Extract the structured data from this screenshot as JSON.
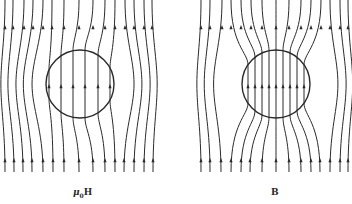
{
  "colors": {
    "line": "#2a2a2a",
    "background": "#ffffff"
  },
  "panels": [
    {
      "id": "muH",
      "label_main": "μ",
      "label_sub": "0",
      "label_tail": "H",
      "label_pos": {
        "x": 73,
        "y": 187
      },
      "circle": {
        "cx": 80,
        "cy": 84,
        "r": 34
      },
      "mode": "diverge",
      "top_xs": [
        5,
        13,
        24,
        33,
        43,
        52,
        64,
        79,
        93,
        105,
        115,
        125,
        134,
        144,
        152
      ],
      "bottom_xs": [
        5,
        14,
        23,
        32,
        43,
        53,
        64,
        79,
        93,
        105,
        115,
        124,
        134,
        144,
        153
      ],
      "inner_xs": [
        49,
        61,
        73,
        85,
        98,
        110
      ],
      "y_top": 0,
      "y_bottom": 172,
      "arrow_top_y": 27,
      "arrow_bottom_y": 160,
      "arrow_mid_y": 86
    },
    {
      "id": "B",
      "label_main": "B",
      "label_sub": "",
      "label_tail": "",
      "label_pos": {
        "x": 271,
        "y": 187
      },
      "circle": {
        "cx": 276,
        "cy": 84,
        "r": 34
      },
      "mode": "converge",
      "top_xs": [
        201,
        210,
        222,
        231,
        241,
        251,
        262,
        276,
        289,
        301,
        311,
        321,
        330,
        340,
        348
      ],
      "bottom_xs": [
        201,
        210,
        221,
        231,
        241,
        250,
        262,
        276,
        289,
        301,
        311,
        320,
        330,
        340,
        348
      ],
      "inner_xs": [
        248,
        255,
        262,
        269,
        276,
        283,
        290,
        297,
        304
      ],
      "y_top": 0,
      "y_bottom": 172,
      "arrow_top_y": 27,
      "arrow_bottom_y": 160,
      "arrow_mid_y": 86
    }
  ]
}
